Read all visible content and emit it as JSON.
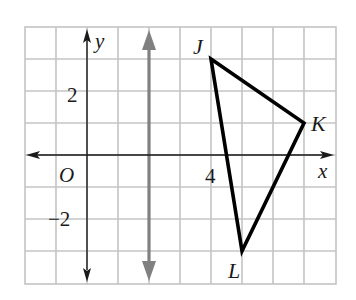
{
  "diagram": {
    "type": "coordinate-plane",
    "grid": {
      "x_min": -2,
      "x_max": 8,
      "y_min": -4,
      "y_max": 4,
      "step": 1,
      "color": "#c4c4c4"
    },
    "axes": {
      "x_label": "x",
      "y_label": "y",
      "origin_label": "O",
      "color": "#1a1a1a"
    },
    "tick_labels": [
      {
        "axis": "y",
        "value": 2,
        "text": "2"
      },
      {
        "axis": "y",
        "value": -2,
        "text": "−2"
      },
      {
        "axis": "x",
        "value": 4,
        "text": "4"
      }
    ],
    "reflection_line": {
      "equation": "x = 2",
      "x": 2,
      "color": "#808080"
    },
    "triangle": {
      "color": "#000000",
      "vertices": [
        {
          "label": "J",
          "x": 4,
          "y": 3
        },
        {
          "label": "K",
          "x": 7,
          "y": 1
        },
        {
          "label": "L",
          "x": 5,
          "y": -3
        }
      ]
    }
  },
  "labels": {
    "y_axis": "y",
    "x_axis": "x",
    "origin": "O",
    "tick_y_pos2": "2",
    "tick_y_neg2": "−2",
    "tick_x_4": "4",
    "vertex_j": "J",
    "vertex_k": "K",
    "vertex_l": "L"
  }
}
